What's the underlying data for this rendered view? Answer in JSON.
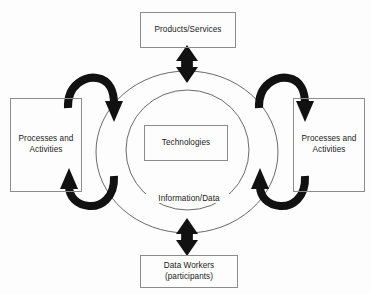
{
  "diagram": {
    "background_color": "#fdfdfd",
    "box_border_color": "#8c8c8c",
    "ellipse_stroke_color": "#595959",
    "arrow_color": "#111111",
    "text_color": "#1a1a1a",
    "nodes": {
      "products_services": {
        "label": "Products/Services",
        "position": "top"
      },
      "data_workers": {
        "line1": "Data Workers",
        "line2": "(participants)",
        "position": "bottom"
      },
      "processes_left": {
        "line1": "Processes and",
        "line2": "Activities",
        "position": "left"
      },
      "processes_right": {
        "line1": "Processes and",
        "line2": "Activities",
        "position": "right"
      },
      "technologies": {
        "label": "Technologies",
        "position": "center"
      },
      "information_data": {
        "label": "Information/Data",
        "position": "center-bottom-ellipse"
      }
    },
    "connectors": {
      "top_double_arrow": "vertical-double-headed-arrow",
      "bottom_double_arrow": "vertical-double-headed-arrow",
      "top_left_curved_arrow": "curved-arrow-clockwise",
      "bottom_left_curved_arrow": "curved-arrow-counterclockwise",
      "top_right_curved_arrow": "curved-arrow-clockwise",
      "bottom_right_curved_arrow": "curved-arrow-counterclockwise"
    },
    "shapes": {
      "outer_ellipse": "outer-ellipse",
      "inner_ellipse": "inner-ellipse"
    }
  }
}
